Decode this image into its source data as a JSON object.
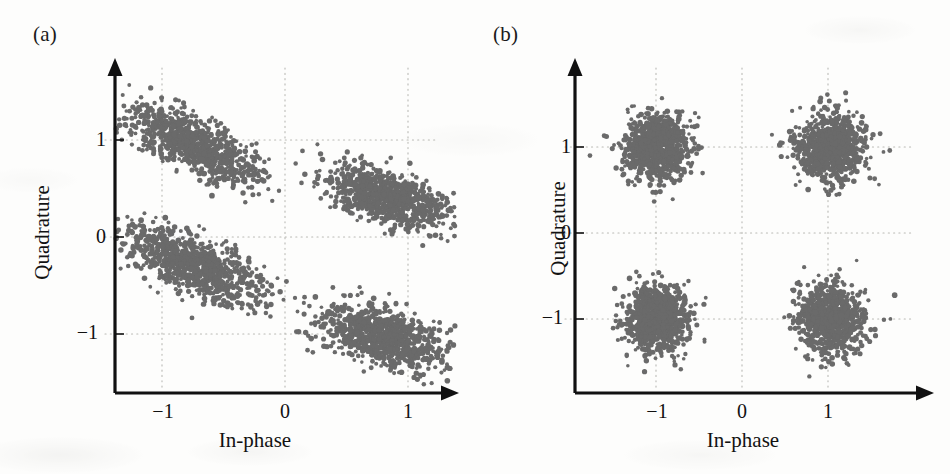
{
  "figure": {
    "background_color": "#fdfdfc",
    "marker_color": "#6a6a6a",
    "axis_color": "#111111",
    "grid_color": "#b9b9b4"
  },
  "panels": [
    {
      "id": "a",
      "label": "(a)",
      "xlabel": "In-phase",
      "ylabel": "Quadrature",
      "xticks": [
        "−1",
        "0",
        "1"
      ],
      "yticks": [
        "1",
        "0",
        "−1"
      ]
    },
    {
      "id": "b",
      "label": "(b)",
      "xlabel": "In-phase",
      "ylabel": "Quadrature",
      "xticks": [
        "−1",
        "0",
        "1"
      ],
      "yticks": [
        "1",
        "0",
        "−1"
      ]
    }
  ],
  "chart_data": [
    {
      "type": "scatter",
      "panel": "(a)",
      "title": "",
      "xlabel": "In-phase",
      "ylabel": "Quadrature",
      "xticks": [
        -1,
        0,
        1
      ],
      "yticks": [
        -1,
        0,
        1
      ],
      "xlim": [
        -1.55,
        1.45
      ],
      "ylim": [
        -1.5,
        1.7
      ],
      "grid": true,
      "legend": null,
      "description": "Received QPSK constellation with phase rotation and residual carrier offset: clusters are tilted elongated ellipses, rotated clockwise from the ideal (±1, ±1) positions.",
      "marker_color": "#6a6a6a",
      "marker_size_px": 3.2,
      "points_per_cluster": 900,
      "clusters": [
        {
          "name": "symbol-00",
          "ideal": [
            -1,
            1
          ],
          "center": [
            -0.74,
            0.95
          ],
          "sigma_major": 0.3,
          "sigma_minor": 0.12,
          "angle_deg": -33
        },
        {
          "name": "symbol-01",
          "ideal": [
            1,
            1
          ],
          "center": [
            0.86,
            0.4
          ],
          "sigma_major": 0.27,
          "sigma_minor": 0.12,
          "angle_deg": -25
        },
        {
          "name": "symbol-10",
          "ideal": [
            -1,
            -1
          ],
          "center": [
            -0.72,
            -0.3
          ],
          "sigma_major": 0.3,
          "sigma_minor": 0.13,
          "angle_deg": -33
        },
        {
          "name": "symbol-11",
          "ideal": [
            1,
            -1
          ],
          "center": [
            0.8,
            -1.03
          ],
          "sigma_major": 0.26,
          "sigma_minor": 0.14,
          "angle_deg": -22
        }
      ]
    },
    {
      "type": "scatter",
      "panel": "(b)",
      "title": "",
      "xlabel": "In-phase",
      "ylabel": "Quadrature",
      "xticks": [
        -1,
        0,
        1
      ],
      "yticks": [
        -1,
        0,
        1
      ],
      "xlim": [
        -1.6,
        1.55
      ],
      "ylim": [
        -1.6,
        1.7
      ],
      "grid": true,
      "legend": null,
      "description": "Equalised/compensated QPSK constellation: four isotropic circular clusters centred on the ideal (±1, ±1) symbol points.",
      "marker_color": "#6a6a6a",
      "marker_size_px": 3.2,
      "points_per_cluster": 900,
      "clusters": [
        {
          "name": "symbol-00",
          "ideal": [
            -1,
            1
          ],
          "center": [
            -0.98,
            1.0
          ],
          "sigma_major": 0.19,
          "sigma_minor": 0.19,
          "angle_deg": 0
        },
        {
          "name": "symbol-01",
          "ideal": [
            1,
            1
          ],
          "center": [
            1.02,
            1.0
          ],
          "sigma_major": 0.19,
          "sigma_minor": 0.19,
          "angle_deg": 0
        },
        {
          "name": "symbol-10",
          "ideal": [
            -1,
            -1
          ],
          "center": [
            -0.98,
            -1.0
          ],
          "sigma_major": 0.19,
          "sigma_minor": 0.19,
          "angle_deg": 0
        },
        {
          "name": "symbol-11",
          "ideal": [
            1,
            -1
          ],
          "center": [
            1.02,
            -1.0
          ],
          "sigma_major": 0.19,
          "sigma_minor": 0.19,
          "angle_deg": 0
        }
      ]
    }
  ]
}
